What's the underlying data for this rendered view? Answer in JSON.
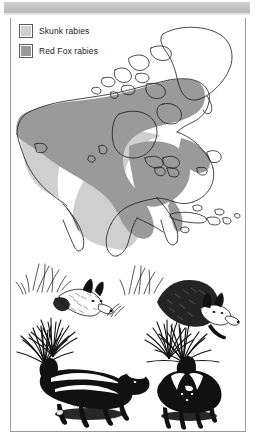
{
  "figure": {
    "legend": {
      "items": [
        {
          "label": "Skunk rabies",
          "color": "#cfcfcf",
          "icon": "legend-swatch"
        },
        {
          "label": "Red Fox rabies",
          "color": "#9a9a9a",
          "icon": "legend-swatch"
        }
      ]
    },
    "map": {
      "region": "North America",
      "background": "#ffffff",
      "outline_color": "#1a1a1a",
      "skunk_shade": "#cfcfcf",
      "fox_shade": "#9a9a9a"
    },
    "illustrations": [
      {
        "name": "red-fox-left",
        "species": "Red Fox",
        "pose": "crouching in grass"
      },
      {
        "name": "red-fox-right",
        "species": "Red Fox",
        "pose": "standing behind grass"
      },
      {
        "name": "skunk-left",
        "species": "Striped Skunk",
        "pose": "walking, tail raised"
      },
      {
        "name": "skunk-right",
        "species": "Striped Skunk",
        "pose": "standing, tail raised"
      }
    ]
  }
}
